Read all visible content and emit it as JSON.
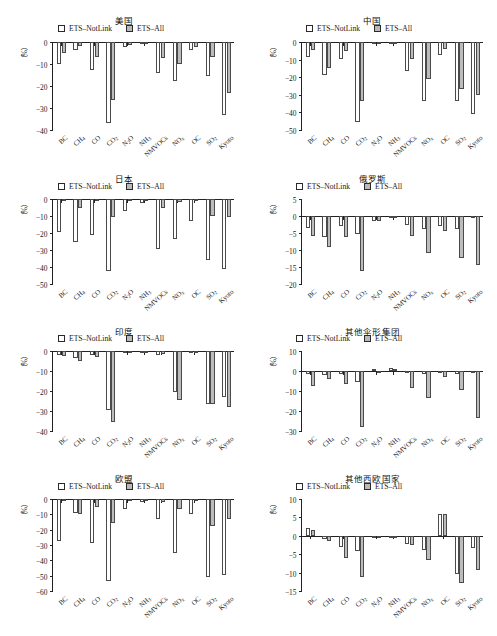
{
  "figure": {
    "series": [
      {
        "key": "notlink",
        "label": "ETS–NotLink",
        "color": "#ffffff"
      },
      {
        "key": "all",
        "label": "ETS–All",
        "color": "#bcbcbc"
      }
    ],
    "categories": [
      "BC",
      "CH₄",
      "CO",
      "CO₂",
      "N₂O",
      "NH₃",
      "NMVOCs",
      "NOₓ",
      "OC",
      "SO₂",
      "Kyoto"
    ],
    "ylabel": "（%）"
  },
  "chart_data": [
    {
      "type": "bar",
      "title": "美国",
      "ylabel": "（%）",
      "xlabel": "",
      "ylim": [
        -40,
        0
      ],
      "yticks": [
        0,
        -10,
        -20,
        -30,
        -40
      ],
      "ytick_labels": [
        "0",
        "−10",
        "−20",
        "−30",
        "−40"
      ],
      "categories": [
        "BC",
        "CH₄",
        "CO",
        "CO₂",
        "N₂O",
        "NH₃",
        "NMVOCs",
        "NOₓ",
        "OC",
        "SO₂",
        "Kyoto"
      ],
      "series": [
        {
          "name": "ETS–NotLink",
          "values": [
            -10.2,
            -3.6,
            -12.8,
            -36.6,
            -2.2,
            -0.5,
            -14.3,
            -17.8,
            -3.8,
            -15.3,
            -33.2
          ]
        },
        {
          "name": "ETS–All",
          "values": [
            -4.8,
            -1.9,
            -6.7,
            -26.5,
            -1.5,
            -0.4,
            -7.3,
            -9.9,
            -2.4,
            -6.9,
            -23.4
          ]
        }
      ],
      "legend_position": "top-center",
      "grid": false
    },
    {
      "type": "bar",
      "title": "中国",
      "ylabel": "（%）",
      "xlabel": "",
      "ylim": [
        -50,
        0
      ],
      "yticks": [
        0,
        -10,
        -20,
        -30,
        -40,
        -50
      ],
      "ytick_labels": [
        "0",
        "−10",
        "−20",
        "−30",
        "−40",
        "−50"
      ],
      "categories": [
        "BC",
        "CH₄",
        "CO",
        "CO₂",
        "N₂O",
        "NH₃",
        "NMVOCs",
        "NOₓ",
        "OC",
        "SO₂",
        "Kyoto"
      ],
      "series": [
        {
          "name": "ETS–NotLink",
          "values": [
            -8.7,
            -19.0,
            -9.8,
            -45.7,
            -1.0,
            -0.7,
            -16.4,
            -33.6,
            -7.3,
            -33.5,
            -40.7
          ]
        },
        {
          "name": "ETS–All",
          "values": [
            -4.3,
            -14.6,
            -4.9,
            -33.3,
            -0.6,
            -0.4,
            -9.6,
            -20.8,
            -3.7,
            -26.8,
            -29.9
          ]
        }
      ],
      "legend_position": "top-center",
      "grid": false
    },
    {
      "type": "bar",
      "title": "日本",
      "ylabel": "（%）",
      "xlabel": "",
      "ylim": [
        -50,
        0
      ],
      "yticks": [
        0,
        -10,
        -20,
        -30,
        -40,
        -50
      ],
      "ytick_labels": [
        "0",
        "−10",
        "−20",
        "−30",
        "−40",
        "−50"
      ],
      "categories": [
        "BC",
        "CH₄",
        "CO",
        "CO₂",
        "N₂O",
        "NH₃",
        "NMVOCs",
        "NOₓ",
        "OC",
        "SO₂",
        "Kyoto"
      ],
      "series": [
        {
          "name": "ETS–NotLink",
          "values": [
            -19.4,
            -25.2,
            -21.2,
            -42.2,
            -6.9,
            -2.1,
            -29.6,
            -23.5,
            -13.2,
            -36.0,
            -41.3
          ]
        },
        {
          "name": "ETS–All",
          "values": [
            -0.9,
            -5.3,
            -1.2,
            -10.8,
            -0.5,
            -0.3,
            -5.3,
            -1.8,
            -0.4,
            -10.2,
            -10.5
          ]
        }
      ],
      "legend_position": "top-center",
      "grid": false
    },
    {
      "type": "bar",
      "title": "俄罗斯",
      "ylabel": "（%）",
      "xlabel": "",
      "ylim": [
        -20,
        5
      ],
      "yticks": [
        5,
        0,
        -5,
        -10,
        -15,
        -20
      ],
      "ytick_labels": [
        "5",
        "0",
        "−5",
        "−10",
        "−15",
        "−20"
      ],
      "categories": [
        "BC",
        "CH₄",
        "CO",
        "CO₂",
        "N₂O",
        "NH₃",
        "NMVOCs",
        "NOₓ",
        "OC",
        "SO₂",
        "Kyoto"
      ],
      "series": [
        {
          "name": "ETS–NotLink",
          "values": [
            -3.4,
            -6.2,
            -3.0,
            -5.2,
            -1.4,
            -0.2,
            -2.6,
            -3.8,
            -2.8,
            -3.8,
            -0.3
          ]
        },
        {
          "name": "ETS–All",
          "values": [
            -5.9,
            -9.2,
            -6.2,
            -16.1,
            -1.5,
            -0.3,
            -6.0,
            -10.8,
            -4.4,
            -12.3,
            -14.5
          ]
        }
      ],
      "legend_position": "top-center",
      "grid": false
    },
    {
      "type": "bar",
      "title": "印度",
      "ylabel": "（%）",
      "xlabel": "",
      "ylim": [
        -40,
        0
      ],
      "yticks": [
        0,
        -10,
        -20,
        -30,
        -40
      ],
      "ytick_labels": [
        "0",
        "−10",
        "−20",
        "−30",
        "−40"
      ],
      "categories": [
        "BC",
        "CH₄",
        "CO",
        "CO₂",
        "N₂O",
        "NH₃",
        "NMVOCs",
        "NOₓ",
        "OC",
        "SO₂",
        "Kyoto"
      ],
      "series": [
        {
          "name": "ETS–NotLink",
          "values": [
            -1.9,
            -3.3,
            -2.1,
            -29.5,
            -0.7,
            -0.4,
            -1.8,
            -20.3,
            -0.6,
            -26.5,
            -23.0
          ]
        },
        {
          "name": "ETS–All",
          "values": [
            -2.3,
            -5.0,
            -3.0,
            -35.4,
            -0.6,
            -0.4,
            -1.7,
            -24.5,
            -0.7,
            -26.7,
            -27.8
          ]
        }
      ],
      "legend_position": "top-center",
      "grid": false
    },
    {
      "type": "bar",
      "title": "其他伞形集团",
      "ylabel": "（%）",
      "xlabel": "",
      "ylim": [
        -30,
        10
      ],
      "yticks": [
        10,
        0,
        -10,
        -20,
        -30
      ],
      "ytick_labels": [
        "10",
        "0",
        "−10",
        "−20",
        "−30"
      ],
      "categories": [
        "BC",
        "CH₄",
        "CO",
        "CO₂",
        "N₂O",
        "NH₃",
        "NMVOCs",
        "NOₓ",
        "OC",
        "SO₂",
        "Kyoto"
      ],
      "series": [
        {
          "name": "ETS–NotLink",
          "values": [
            -1.6,
            -1.8,
            -1.4,
            -5.5,
            1.2,
            1.4,
            -1.1,
            -1.3,
            -1.2,
            -1.7,
            -0.5
          ]
        },
        {
          "name": "ETS–All",
          "values": [
            -7.6,
            -3.9,
            -6.3,
            -27.9,
            -0.4,
            0.9,
            -8.4,
            -13.3,
            -3.0,
            -9.3,
            -23.6
          ]
        }
      ],
      "legend_position": "top-center",
      "grid": false
    },
    {
      "type": "bar",
      "title": "欧盟",
      "ylabel": "（%）",
      "xlabel": "",
      "ylim": [
        -60,
        0
      ],
      "yticks": [
        0,
        -10,
        -20,
        -30,
        -40,
        -50,
        -60
      ],
      "ytick_labels": [
        "0",
        "−10",
        "−20",
        "−30",
        "−40",
        "−50",
        "−60"
      ],
      "categories": [
        "BC",
        "CH₄",
        "CO",
        "CO₂",
        "N₂O",
        "NH₃",
        "NMVOCs",
        "NOₓ",
        "OC",
        "SO₂",
        "Kyoto"
      ],
      "series": [
        {
          "name": "ETS–NotLink",
          "values": [
            -27.3,
            -9.3,
            -28.5,
            -53.8,
            -6.5,
            -2.0,
            -12.9,
            -35.3,
            -10.0,
            -50.7,
            -49.5
          ]
        },
        {
          "name": "ETS–All",
          "values": [
            -1.5,
            -9.5,
            -5.0,
            -15.5,
            -0.6,
            -0.5,
            -2.2,
            -6.8,
            -0.5,
            -17.3,
            -12.8
          ]
        }
      ],
      "legend_position": "top-center",
      "grid": false
    },
    {
      "type": "bar",
      "title": "其他西欧国家",
      "ylabel": "（%）",
      "xlabel": "",
      "ylim": [
        -15,
        10
      ],
      "yticks": [
        10,
        5,
        0,
        -5,
        -10,
        -15
      ],
      "ytick_labels": [
        "10",
        "5",
        "0",
        "−5",
        "−10",
        "−15"
      ],
      "categories": [
        "BC",
        "CH₄",
        "CO",
        "CO₂",
        "N₂O",
        "NH₃",
        "NMVOCs",
        "NOₓ",
        "OC",
        "SO₂",
        "Kyoto"
      ],
      "series": [
        {
          "name": "ETS–NotLink",
          "values": [
            2.1,
            -1.0,
            -3.1,
            -4.1,
            -0.4,
            -0.3,
            -2.3,
            -3.8,
            6.0,
            -10.5,
            -3.3
          ]
        },
        {
          "name": "ETS–All",
          "values": [
            1.5,
            -1.4,
            -6.1,
            -11.3,
            -0.5,
            -0.3,
            -2.4,
            -6.7,
            6.0,
            -12.9,
            -9.3
          ]
        }
      ],
      "legend_position": "top-center",
      "grid": false
    }
  ]
}
